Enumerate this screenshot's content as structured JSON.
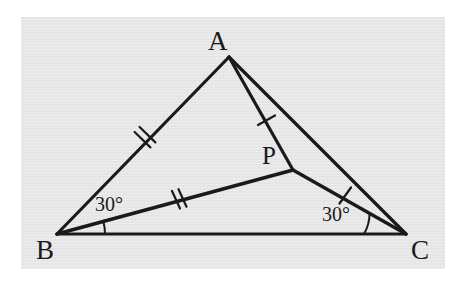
{
  "figure": {
    "kind": "geometry-diagram",
    "paper_color": "#e8e8e8",
    "page_color": "#ffffff",
    "ink_color": "#1a1a1a",
    "vertices": [
      {
        "name": "A",
        "label": "A",
        "x": 229,
        "y": 57,
        "label_x": 208,
        "label_y": 28
      },
      {
        "name": "B",
        "label": "B",
        "x": 57,
        "y": 234,
        "label_x": 36,
        "label_y": 237
      },
      {
        "name": "C",
        "label": "C",
        "x": 406,
        "y": 234,
        "label_x": 411,
        "label_y": 237
      },
      {
        "name": "P",
        "label": "P",
        "x": 293,
        "y": 170,
        "label_x": 262,
        "label_y": 143
      }
    ],
    "segments": [
      {
        "name": "AB",
        "from": "A",
        "to": "B",
        "ticks": 2
      },
      {
        "name": "BC",
        "from": "B",
        "to": "C",
        "ticks": 0
      },
      {
        "name": "AC",
        "from": "A",
        "to": "C",
        "ticks": 0
      },
      {
        "name": "AP",
        "from": "A",
        "to": "P",
        "ticks": 1
      },
      {
        "name": "BP",
        "from": "B",
        "to": "P",
        "ticks": 2
      },
      {
        "name": "PC",
        "from": "P",
        "to": "C",
        "ticks": 1
      }
    ],
    "angles": [
      {
        "name": "angle-PBC",
        "at": "B",
        "value": "30°",
        "label_x": 95,
        "label_y": 194
      },
      {
        "name": "angle-PCB",
        "at": "C",
        "value": "30°",
        "label_x": 322,
        "label_y": 204
      }
    ]
  }
}
